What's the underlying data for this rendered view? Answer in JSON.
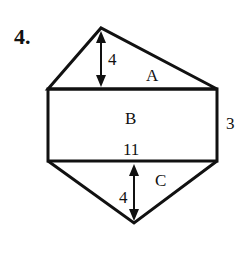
{
  "problem": {
    "number": "4."
  },
  "figure": {
    "regions": {
      "A": {
        "label": "A",
        "shape": "triangle",
        "height_label": "4"
      },
      "B": {
        "label": "B",
        "shape": "rectangle",
        "width_label": "11",
        "height_label": "3"
      },
      "C": {
        "label": "C",
        "shape": "triangle",
        "height_label": "4"
      }
    },
    "colors": {
      "stroke": "#111111",
      "background": "#ffffff"
    }
  }
}
